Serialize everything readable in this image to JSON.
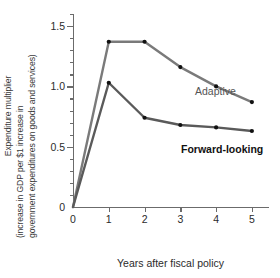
{
  "chart_data": {
    "type": "line",
    "title": "",
    "xlabel": "Years after fiscal policy",
    "ylabel_lines": [
      "Expenditure multiplier",
      "(increase in GDP per $1 increase in",
      "government expenditures on goods and services)"
    ],
    "x": [
      0,
      1,
      2,
      3,
      4,
      5
    ],
    "xlim": [
      0,
      5.45
    ],
    "ylim": [
      0,
      1.6
    ],
    "xticks": [
      "0",
      "1",
      "2",
      "3",
      "4",
      "5"
    ],
    "yticks": [
      "0",
      "0.5",
      "1.0",
      "1.5"
    ],
    "ytick_values": [
      0,
      0.5,
      1.0,
      1.5
    ],
    "yminor_step": 0.1,
    "grid": false,
    "legend_position": "inline-annotation",
    "series": [
      {
        "name": "Adaptive",
        "color": "#7a7a7a",
        "label_color": "#545454",
        "label_bold": false,
        "values": [
          0,
          1.37,
          1.37,
          1.16,
          1.0,
          0.87
        ]
      },
      {
        "name": "Forward-looking",
        "color": "#5a5a5a",
        "label_color": "#111111",
        "label_bold": true,
        "values": [
          0,
          1.03,
          0.74,
          0.68,
          0.66,
          0.63
        ]
      }
    ],
    "annotations": [
      {
        "text": "Adaptive",
        "series": "Adaptive"
      },
      {
        "text": "Forward-looking",
        "series": "Forward-looking"
      }
    ],
    "axis_color": "#6b6b6b",
    "marker_color": "#111111",
    "background": "#ffffff"
  }
}
